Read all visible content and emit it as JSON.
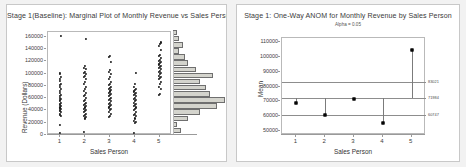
{
  "left_panel": {
    "title": "Stage 1(Baseline): Marginal Plot of Monthly Revenue vs Sales Person",
    "xlabel": "Sales Person",
    "ylabel": "Revenue (Dollars)",
    "yticks": [
      "0",
      "20000",
      "40000",
      "60000",
      "80000",
      "100000",
      "120000",
      "140000",
      "160000"
    ],
    "xticks": [
      "1",
      "2",
      "3",
      "4",
      "5"
    ]
  },
  "right_panel": {
    "title": "Stage 1: One-Way ANOM for Monthly Revenue by Sales Person",
    "subtitle": "Alpha = 0.05",
    "xlabel": "Sales Person",
    "ylabel": "Mean",
    "yticks": [
      "50000",
      "60000",
      "70000",
      "80000",
      "90000",
      "100000",
      "110000"
    ],
    "xticks": [
      "1",
      "2",
      "3",
      "4",
      "5"
    ],
    "limit_labels": {
      "upper": "83021",
      "center": "71984",
      "lower": "60747"
    }
  },
  "chart_data": [
    {
      "type": "scatter",
      "title": "Stage 1(Baseline): Marginal Plot of Monthly Revenue vs Sales Person",
      "subtitle": "",
      "xlabel": "Sales Person",
      "ylabel": "Revenue (Dollars)",
      "xlim": [
        0.5,
        5.5
      ],
      "ylim": [
        0,
        168000
      ],
      "xticks": [
        1,
        2,
        3,
        4,
        5
      ],
      "yticks": [
        0,
        20000,
        40000,
        60000,
        80000,
        100000,
        120000,
        140000,
        160000
      ],
      "grid": false,
      "legend": "none",
      "marginal": "histogram-right",
      "series": [
        {
          "name": "Sales Person 1",
          "x": 1,
          "values": [
            3000,
            17000,
            31000,
            33000,
            35000,
            37000,
            39000,
            41000,
            42000,
            44000,
            45000,
            47000,
            49000,
            51000,
            53000,
            55000,
            57000,
            59000,
            61000,
            63000,
            66000,
            69000,
            72000,
            75000,
            78000,
            81000,
            84000,
            88000,
            91000,
            95000,
            99000,
            101000,
            161000
          ]
        },
        {
          "name": "Sales Person 2",
          "x": 2,
          "values": [
            5000,
            27000,
            29000,
            31000,
            33000,
            35000,
            37000,
            39000,
            41000,
            43000,
            45000,
            47000,
            49000,
            51000,
            53000,
            55000,
            57000,
            60000,
            63000,
            66000,
            69000,
            72000,
            75000,
            79000,
            83000,
            87000,
            91000,
            95000,
            97000,
            99000,
            101000,
            103000,
            107000,
            110000,
            113000,
            157000
          ]
        },
        {
          "name": "Sales Person 3",
          "x": 3,
          "values": [
            29000,
            31000,
            35000,
            38000,
            41000,
            43000,
            45000,
            47000,
            49000,
            51000,
            53000,
            55000,
            57000,
            59000,
            61000,
            63000,
            65000,
            67000,
            69000,
            71000,
            73000,
            75000,
            77000,
            79000,
            81000,
            83000,
            87000,
            91000,
            95000,
            99000,
            103000,
            106000,
            119000,
            127000,
            129000
          ]
        },
        {
          "name": "Sales Person 4",
          "x": 4,
          "values": [
            3000,
            19000,
            21000,
            23000,
            27000,
            31000,
            33000,
            35000,
            37000,
            41000,
            43000,
            45000,
            47000,
            49000,
            51000,
            53000,
            55000,
            57000,
            59000,
            61000,
            63000,
            65000,
            67000,
            69000,
            71000,
            73000,
            75000,
            79000,
            83000,
            101000
          ]
        },
        {
          "name": "Sales Person 5",
          "x": 5,
          "values": [
            65000,
            67000,
            75000,
            79000,
            83000,
            87000,
            91000,
            93000,
            95000,
            97000,
            99000,
            101000,
            103000,
            105000,
            107000,
            109000,
            111000,
            113000,
            115000,
            117000,
            119000,
            121000,
            123000,
            125000,
            129000,
            131000,
            139000,
            145000,
            148000,
            151000
          ]
        }
      ],
      "marginal_histogram": {
        "orientation": "horizontal",
        "bin_width": 10000,
        "bins": [
          {
            "center": 5000,
            "count": 4
          },
          {
            "center": 15000,
            "count": 2
          },
          {
            "center": 25000,
            "count": 7
          },
          {
            "center": 35000,
            "count": 13
          },
          {
            "center": 45000,
            "count": 21
          },
          {
            "center": 55000,
            "count": 25
          },
          {
            "center": 65000,
            "count": 18
          },
          {
            "center": 75000,
            "count": 16
          },
          {
            "center": 85000,
            "count": 13
          },
          {
            "center": 95000,
            "count": 19
          },
          {
            "center": 105000,
            "count": 11
          },
          {
            "center": 115000,
            "count": 7
          },
          {
            "center": 125000,
            "count": 6
          },
          {
            "center": 135000,
            "count": 3
          },
          {
            "center": 145000,
            "count": 5
          },
          {
            "center": 155000,
            "count": 3
          },
          {
            "center": 165000,
            "count": 2
          }
        ]
      }
    },
    {
      "type": "scatter",
      "subtype": "anom",
      "title": "Stage 1: One-Way ANOM for Monthly Revenue by Sales Person",
      "subtitle": "Alpha = 0.05",
      "xlabel": "Sales Person",
      "ylabel": "Mean",
      "xlim": [
        0.5,
        5.5
      ],
      "ylim": [
        47000,
        113000
      ],
      "xticks": [
        1,
        2,
        3,
        4,
        5
      ],
      "yticks": [
        50000,
        60000,
        70000,
        80000,
        90000,
        100000,
        110000
      ],
      "grid": false,
      "legend": "none",
      "categories": [
        "1",
        "2",
        "3",
        "4",
        "5"
      ],
      "values": [
        68500,
        60300,
        71300,
        55300,
        105000
      ],
      "center_line": 71984,
      "upper_decision_limit": 83021,
      "lower_decision_limit": 60747,
      "annotations": [
        {
          "text": "83021",
          "y": 83021,
          "position": "right"
        },
        {
          "text": "71984",
          "y": 71984,
          "position": "right"
        },
        {
          "text": "60747",
          "y": 60747,
          "position": "right"
        }
      ]
    }
  ]
}
